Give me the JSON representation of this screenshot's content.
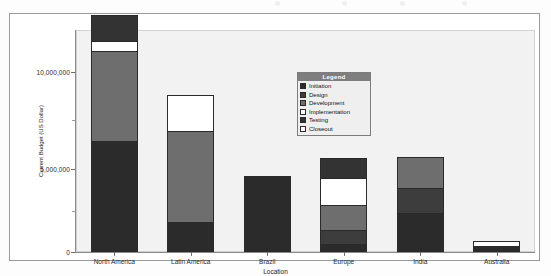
{
  "chart_data": {
    "type": "bar",
    "subtype": "stacked-bar",
    "title": "",
    "xlabel": "Location",
    "ylabel": "Current Budget (US Dollar)",
    "ylim": [
      0,
      13500000
    ],
    "yticks": [
      0,
      5000000,
      10000000
    ],
    "ytick_labels": [
      "0",
      "5,000,000",
      "10,000,000"
    ],
    "grid": false,
    "legend_position": "inside-upper-center",
    "categories": [
      "North America",
      "Latin America",
      "Brazil",
      "Europe",
      "India",
      "Australia"
    ],
    "series": [
      {
        "name": "Initiation",
        "color": "#2b2b2b",
        "values": [
          6100000,
          1550000,
          4200000,
          320000,
          2100000,
          300000
        ]
      },
      {
        "name": "Design",
        "color": "#3d3d3d",
        "values": [
          0,
          0,
          0,
          800000,
          1400000,
          0
        ]
      },
      {
        "name": "Development",
        "color": "#6e6e6e",
        "values": [
          5050000,
          5150000,
          0,
          1450000,
          1800000,
          0
        ]
      },
      {
        "name": "Implementation",
        "color": "#ffffff",
        "values": [
          560000,
          2000000,
          0,
          1500000,
          0,
          330000
        ]
      },
      {
        "name": "Testing",
        "color": "#333333",
        "values": [
          1440000,
          0,
          0,
          1150000,
          0,
          0
        ]
      },
      {
        "name": "Closeout",
        "color": "#ffffff",
        "values": [
          0,
          0,
          0,
          0,
          0,
          0
        ]
      }
    ],
    "totals": [
      13150000,
      8700000,
      4200000,
      5220000,
      5300000,
      630000
    ]
  },
  "legend": {
    "header": "Legend",
    "items": [
      {
        "label": "Initiation",
        "color": "#2b2b2b"
      },
      {
        "label": "Design",
        "color": "#3d3d3d"
      },
      {
        "label": "Development",
        "color": "#6e6e6e"
      },
      {
        "label": "Implementation",
        "color": "#ffffff"
      },
      {
        "label": "Testing",
        "color": "#333333"
      },
      {
        "label": "Closeout",
        "color": "#ffffff"
      }
    ]
  },
  "axes": {
    "y_title": "Current Budget (US Dollar)",
    "x_title": "Location",
    "y_tick_labels": [
      "10,000,000",
      "5,000,000",
      "0"
    ],
    "x_tick_labels": [
      "North America",
      "Latin America",
      "Brazil",
      "Europe",
      "India",
      "Australia"
    ]
  },
  "colors": {
    "plot_background": "#f2f2f2",
    "frame_border": "#9a9a9a",
    "axis": "#8a8a8a",
    "legend_header_bg": "#7f7f7f",
    "legend_bg": "#efefef"
  }
}
